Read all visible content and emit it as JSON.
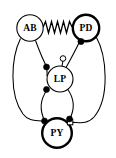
{
  "diagram": {
    "canvas": {
      "width": 116,
      "height": 158,
      "background": "#ffffff"
    },
    "ink_color": "#000000",
    "nodes": [
      {
        "id": "AB",
        "label": "AB",
        "cx": 30,
        "cy": 28,
        "r": 13.2,
        "border": "thin"
      },
      {
        "id": "PD",
        "label": "PD",
        "cx": 86,
        "cy": 28,
        "r": 13.2,
        "border": "thick"
      },
      {
        "id": "LP",
        "label": "LP",
        "cx": 60,
        "cy": 79,
        "r": 13.0,
        "border": "thin"
      },
      {
        "id": "PY",
        "label": "PY",
        "cx": 57,
        "cy": 133,
        "r": 14.8,
        "border": "thick"
      }
    ],
    "gap_junction": {
      "from": "AB",
      "to": "PD",
      "symbol": "resistor-zigzag",
      "peaks": 5,
      "x_start": 43,
      "x_end": 73,
      "y": 27,
      "amplitude": 6
    },
    "synapses": [
      {
        "id": "ab-to-lp",
        "from": "AB",
        "to": "LP",
        "terminal": "filled-circle",
        "x": 46,
        "y": 67
      },
      {
        "id": "ab-to-py",
        "from": "AB",
        "to": "PY",
        "terminal": "filled-circle",
        "x": 44,
        "y": 121
      },
      {
        "id": "pd-to-lp",
        "from": "PD",
        "to": "LP",
        "terminal": "filled-circle",
        "x": 81,
        "y": 42
      },
      {
        "id": "pd-to-py",
        "from": "PD",
        "to": "PY",
        "terminal": "open-square",
        "x": 70,
        "y": 122
      },
      {
        "id": "lp-to-pd",
        "from": "LP",
        "to": "PD",
        "terminal": "open-circle",
        "x": 63,
        "y": 59
      },
      {
        "id": "lp-to-py",
        "from": "LP",
        "to": "PY",
        "terminal": "filled-circle",
        "x": 46,
        "y": 90
      },
      {
        "id": "py-to-lp",
        "from": "PY",
        "to": "LP",
        "terminal": "filled-circle",
        "x": 70,
        "y": 120
      }
    ],
    "legend_note": {
      "filled_circle": "inhibitory chemical synapse",
      "open_circle": "modulatory / excitatory synapse",
      "zigzag": "electrical gap junction"
    }
  }
}
